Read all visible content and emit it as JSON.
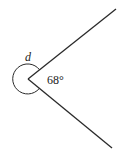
{
  "diagram": {
    "type": "angle",
    "vertex": [
      28,
      79
    ],
    "rays": [
      {
        "name": "upper-ray",
        "end": [
          116,
          9
        ]
      },
      {
        "name": "lower-ray",
        "end": [
          112,
          148
        ]
      }
    ],
    "reflex_angle_label": "d",
    "interior_angle_label": "68°",
    "line_color": "#2a2a2a"
  }
}
